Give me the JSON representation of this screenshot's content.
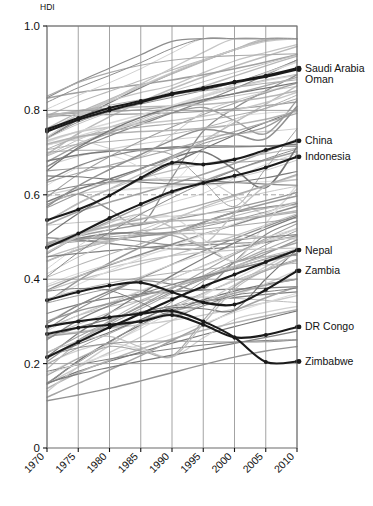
{
  "chart_data": {
    "type": "line",
    "title": "",
    "subtitle": "",
    "xlabel": "",
    "ylabel": "HDI",
    "ylim": [
      0,
      1.0
    ],
    "xlim": [
      1970,
      2010
    ],
    "grid": true,
    "legend_position": "right-inline-labels",
    "x": [
      1970,
      1975,
      1980,
      1985,
      1990,
      1995,
      2000,
      2005,
      2010
    ],
    "xtick_labels": [
      "1970",
      "1975",
      "1980",
      "1985",
      "1990",
      "1995",
      "2000",
      "2005",
      "2010"
    ],
    "ytick_labels": [
      "0",
      "0.2",
      "0.4",
      "0.6",
      "0.8",
      "1.0"
    ],
    "ytick_values": [
      0,
      0.2,
      0.4,
      0.6,
      0.8,
      1.0
    ],
    "dashed_gridline_value": 0.6,
    "highlight_color": "#1a1a1a",
    "background_color": "#ffffff",
    "axis_color": "#777777",
    "gridline_color": "#999999",
    "series": [
      {
        "name": "Saudi Arabia",
        "highlighted": true,
        "label": "Saudi Arabia",
        "values": [
          0.755,
          0.782,
          0.806,
          0.822,
          0.84,
          0.853,
          0.868,
          0.882,
          0.9
        ]
      },
      {
        "name": "Oman",
        "highlighted": true,
        "label": "Oman",
        "values": [
          0.75,
          0.778,
          0.8,
          0.819,
          0.838,
          0.851,
          0.866,
          0.88,
          0.897
        ]
      },
      {
        "name": "China",
        "highlighted": true,
        "label": "China",
        "values": [
          0.54,
          0.565,
          0.598,
          0.64,
          0.676,
          0.672,
          0.684,
          0.706,
          0.728
        ]
      },
      {
        "name": "Indonesia",
        "highlighted": true,
        "label": "Indonesia",
        "values": [
          0.475,
          0.508,
          0.545,
          0.578,
          0.608,
          0.628,
          0.645,
          0.665,
          0.69
        ]
      },
      {
        "name": "Nepal",
        "highlighted": true,
        "label": "Nepal",
        "values": [
          0.215,
          0.251,
          0.286,
          0.318,
          0.352,
          0.383,
          0.411,
          0.441,
          0.469
        ]
      },
      {
        "name": "Zambia",
        "highlighted": true,
        "label": "Zambia",
        "values": [
          0.35,
          0.37,
          0.385,
          0.392,
          0.37,
          0.345,
          0.34,
          0.375,
          0.42
        ]
      },
      {
        "name": "DR Congo",
        "highlighted": true,
        "label": "DR Congo",
        "values": [
          0.27,
          0.285,
          0.292,
          0.3,
          0.315,
          0.292,
          0.262,
          0.268,
          0.287
        ]
      },
      {
        "name": "Zimbabwe",
        "highlighted": true,
        "label": "Zimbabwe",
        "values": [
          0.288,
          0.3,
          0.31,
          0.318,
          0.325,
          0.3,
          0.262,
          0.204,
          0.205
        ]
      }
    ],
    "background_series_count": 120,
    "background_series_note": "Unlabeled grey HDI trajectories for many countries, 1970-2010"
  }
}
